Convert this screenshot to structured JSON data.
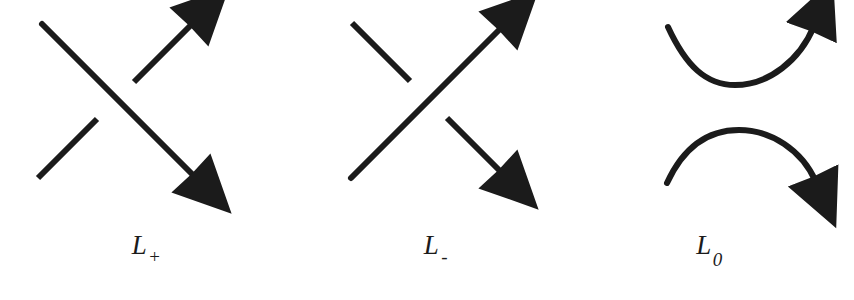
{
  "figure": {
    "background_color": "#ffffff",
    "stroke_color": "#1b1b1b",
    "stroke_width": 6
  },
  "panels": [
    {
      "id": "l-plus",
      "name": "positive-crossing",
      "label_base": "L",
      "label_subscript": "+",
      "label_full": "L+",
      "over_strand": "northwest-to-southeast",
      "under_strand": "southwest-to-northeast",
      "arrows": [
        "northeast",
        "southeast"
      ]
    },
    {
      "id": "l-minus",
      "name": "negative-crossing",
      "label_base": "L",
      "label_subscript": "-",
      "label_full": "L-",
      "over_strand": "southwest-to-northeast",
      "under_strand": "northwest-to-southeast",
      "arrows": [
        "northeast",
        "southeast"
      ]
    },
    {
      "id": "l-zero",
      "name": "oriented-smoothing",
      "label_base": "L",
      "label_subscript": "0",
      "label_full": "L0",
      "upper_curve": "valley-left-to-right",
      "lower_curve": "hill-left-to-right",
      "arrows": [
        "northeast",
        "southeast"
      ]
    }
  ]
}
